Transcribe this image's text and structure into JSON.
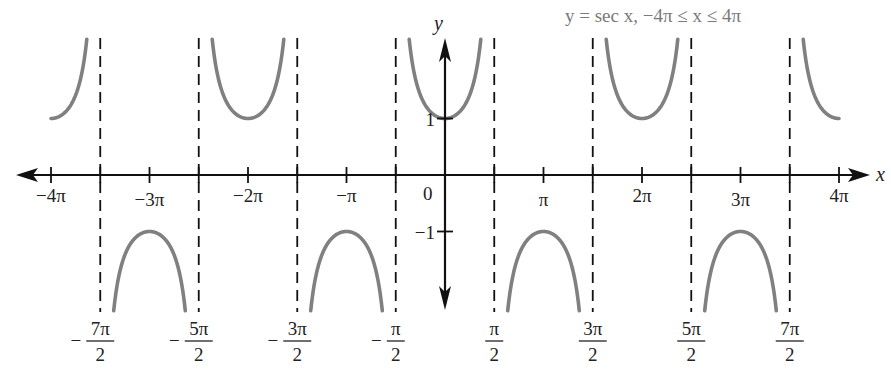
{
  "chart_data": {
    "type": "line",
    "title": "y = sec x, −4π ≤ x ≤ 4π",
    "function": "sec(x)",
    "xlabel": "x",
    "ylabel": "y",
    "xlim_pi": [
      -4,
      4
    ],
    "grid": false,
    "curve_color": "#808080",
    "asymptote_style": "dashed",
    "x_ticks": [
      {
        "value_pi": -4,
        "label": "−4π"
      },
      {
        "value_pi": -3,
        "label": "−3π"
      },
      {
        "value_pi": -2,
        "label": "−2π"
      },
      {
        "value_pi": -1,
        "label": "−π"
      },
      {
        "value_pi": 0,
        "label": "0"
      },
      {
        "value_pi": 1,
        "label": "π"
      },
      {
        "value_pi": 2,
        "label": "2π"
      },
      {
        "value_pi": 3,
        "label": "3π"
      },
      {
        "value_pi": 4,
        "label": "4π"
      }
    ],
    "y_ticks": [
      {
        "value": 1,
        "label": "1"
      },
      {
        "value": -1,
        "label": "−1"
      }
    ],
    "asymptotes": [
      {
        "value_pi": -3.5,
        "sign": "−",
        "num": "7π",
        "den": "2"
      },
      {
        "value_pi": -2.5,
        "sign": "−",
        "num": "5π",
        "den": "2"
      },
      {
        "value_pi": -1.5,
        "sign": "−",
        "num": "3π",
        "den": "2"
      },
      {
        "value_pi": -0.5,
        "sign": "−",
        "num": "π",
        "den": "2"
      },
      {
        "value_pi": 0.5,
        "sign": "",
        "num": "π",
        "den": "2"
      },
      {
        "value_pi": 1.5,
        "sign": "",
        "num": "3π",
        "den": "2"
      },
      {
        "value_pi": 2.5,
        "sign": "",
        "num": "5π",
        "den": "2"
      },
      {
        "value_pi": 3.5,
        "sign": "",
        "num": "7π",
        "den": "2"
      }
    ],
    "branches": [
      {
        "from_pi": -4,
        "to_pi": -3.5,
        "direction": "up",
        "vertex": [
          -4,
          1
        ]
      },
      {
        "from_pi": -3.5,
        "to_pi": -2.5,
        "direction": "down",
        "vertex": [
          -3,
          -1
        ]
      },
      {
        "from_pi": -2.5,
        "to_pi": -1.5,
        "direction": "up",
        "vertex": [
          -2,
          1
        ]
      },
      {
        "from_pi": -1.5,
        "to_pi": -0.5,
        "direction": "down",
        "vertex": [
          -1,
          -1
        ]
      },
      {
        "from_pi": -0.5,
        "to_pi": 0.5,
        "direction": "up",
        "vertex": [
          0,
          1
        ]
      },
      {
        "from_pi": 0.5,
        "to_pi": 1.5,
        "direction": "down",
        "vertex": [
          1,
          -1
        ]
      },
      {
        "from_pi": 1.5,
        "to_pi": 2.5,
        "direction": "up",
        "vertex": [
          2,
          1
        ]
      },
      {
        "from_pi": 2.5,
        "to_pi": 3.5,
        "direction": "down",
        "vertex": [
          3,
          -1
        ]
      },
      {
        "from_pi": 3.5,
        "to_pi": 4,
        "direction": "up",
        "vertex": [
          4,
          1
        ]
      }
    ]
  }
}
